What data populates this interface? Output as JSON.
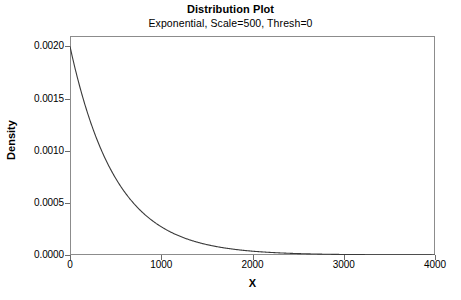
{
  "chart_data": {
    "type": "line",
    "title": "Distribution Plot",
    "subtitle": "Exponential, Scale=500, Thresh=0",
    "xlabel": "X",
    "ylabel": "Density",
    "grid": false,
    "legend": "none",
    "xlim": [
      0,
      4000
    ],
    "ylim": [
      0,
      0.0021
    ],
    "xticks": [
      0,
      1000,
      2000,
      3000,
      4000
    ],
    "xtick_labels": [
      "0",
      "1000",
      "2000",
      "3000",
      "4000"
    ],
    "yticks": [
      0,
      0.0005,
      0.001,
      0.0015,
      0.002
    ],
    "ytick_labels": [
      "0.0000",
      "0.0005",
      "0.0010",
      "0.0015",
      "0.0020"
    ],
    "distribution": "Exponential",
    "scale": 500,
    "threshold": 0,
    "curve_color": "#3a3a3a",
    "frame_color": "#8c8c8c",
    "series": [
      {
        "name": "Exponential pdf",
        "x": [
          0,
          100,
          200,
          300,
          400,
          500,
          600,
          700,
          800,
          900,
          1000,
          1200,
          1400,
          1600,
          1800,
          2000,
          2200,
          2400,
          2600,
          2800,
          3000,
          3200,
          3400,
          3600,
          3800,
          4000
        ],
        "values": [
          0.002,
          0.0016375,
          0.0013406,
          0.0010976,
          0.0008987,
          0.0007358,
          0.0006024,
          0.0004932,
          0.0004038,
          0.0003306,
          0.0002707,
          0.0001815,
          0.0001216,
          8.15e-05,
          5.47e-05,
          3.66e-05,
          2.45e-05,
          1.65e-05,
          1.1e-05,
          7.4e-06,
          5e-06,
          3.3e-06,
          2.2e-06,
          1.5e-06,
          1e-06,
          7e-07
        ]
      }
    ]
  },
  "plot": {
    "title": "Distribution Plot",
    "subtitle": "Exponential, Scale=500, Thresh=0",
    "x_axis_title": "X",
    "y_axis_title": "Density"
  }
}
